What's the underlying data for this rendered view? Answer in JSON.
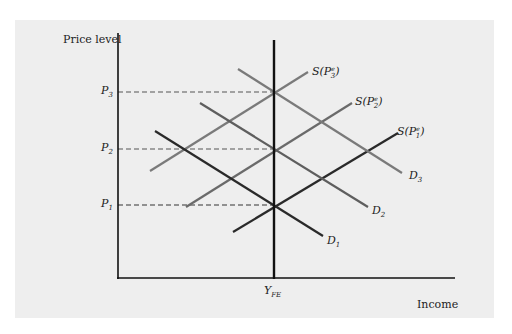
{
  "diagram": {
    "type": "aggregate-supply-demand",
    "y_axis_label": "Price level",
    "x_axis_label": "Income",
    "vertical_line_label": {
      "main": "Y",
      "sub": "FE"
    },
    "price_levels": [
      {
        "name": "P3",
        "main": "P",
        "sub": "3"
      },
      {
        "name": "P2",
        "main": "P",
        "sub": "2"
      },
      {
        "name": "P1",
        "main": "P",
        "sub": "1"
      }
    ],
    "supply_curves": [
      {
        "name": "S(P3e)",
        "prefix": "S(P",
        "sup": "e",
        "sub": "3",
        "suffix": ")"
      },
      {
        "name": "S(P2e)",
        "prefix": "S(P",
        "sup": "e",
        "sub": "2",
        "suffix": ")"
      },
      {
        "name": "S(P1e)",
        "prefix": "S(P",
        "sup": "e",
        "sub": "1",
        "suffix": ")"
      }
    ],
    "demand_curves": [
      {
        "name": "D3",
        "main": "D",
        "sub": "3"
      },
      {
        "name": "D2",
        "main": "D",
        "sub": "2"
      },
      {
        "name": "D1",
        "main": "D",
        "sub": "1"
      }
    ],
    "colors": {
      "panel_bg": "#eeeeee",
      "axis": "#111111",
      "curve_1": "#2a2a2a",
      "curve_2": "#5e5e5e",
      "curve_3": "#7a7a7a",
      "dashed": "#555555"
    }
  }
}
